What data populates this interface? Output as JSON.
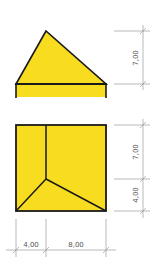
{
  "colors": {
    "fill": "#f7dc1f",
    "outline": "#1a1a1a",
    "dimension": "#8a8a8a",
    "dimension_text": "#555555"
  },
  "elevation_view": {
    "height_dimension": "7,00"
  },
  "plan_view": {
    "height_dimensions": [
      "7,00",
      "4,00"
    ],
    "width_dimensions": [
      "4,00",
      "8,00"
    ]
  }
}
